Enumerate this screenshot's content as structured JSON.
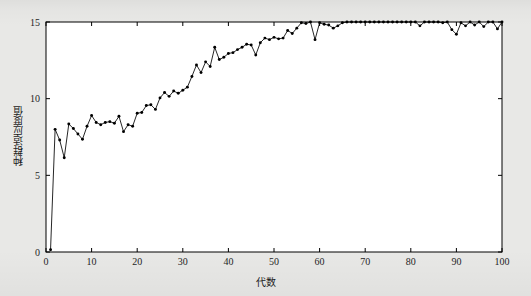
{
  "figure": {
    "background_color": "#e8e8e6",
    "plot_background_color": "#ffffff",
    "axis_color": "#000000",
    "line_color": "#000000",
    "marker_color": "#000000"
  },
  "chart_data": {
    "type": "line",
    "title": "",
    "xlabel": "代数",
    "ylabel": "种群适应度值",
    "xlim": [
      0,
      100
    ],
    "ylim": [
      0,
      15
    ],
    "xticks": [
      0,
      10,
      20,
      30,
      40,
      50,
      60,
      70,
      80,
      90,
      100
    ],
    "xticklabels": [
      "0",
      "10",
      "20",
      "30",
      "40",
      "50",
      "60",
      "70",
      "80",
      "90",
      "100"
    ],
    "yticks": [
      0,
      5,
      10,
      15
    ],
    "yticklabels": [
      "0",
      "5",
      "10",
      "15"
    ],
    "grid": false,
    "legend": null,
    "marker": "dot",
    "x": [
      1,
      2,
      3,
      4,
      5,
      6,
      7,
      8,
      9,
      10,
      11,
      12,
      13,
      14,
      15,
      16,
      17,
      18,
      19,
      20,
      21,
      22,
      23,
      24,
      25,
      26,
      27,
      28,
      29,
      30,
      31,
      32,
      33,
      34,
      35,
      36,
      37,
      38,
      39,
      40,
      41,
      42,
      43,
      44,
      45,
      46,
      47,
      48,
      49,
      50,
      51,
      52,
      53,
      54,
      55,
      56,
      57,
      58,
      59,
      60,
      61,
      62,
      63,
      64,
      65,
      66,
      67,
      68,
      69,
      70,
      71,
      72,
      73,
      74,
      75,
      76,
      77,
      78,
      79,
      80,
      81,
      82,
      83,
      84,
      85,
      86,
      87,
      88,
      89,
      90,
      91,
      92,
      93,
      94,
      95,
      96,
      97,
      98,
      99,
      100
    ],
    "y": [
      0.15,
      8.0,
      7.3,
      6.15,
      8.35,
      8.05,
      7.7,
      7.35,
      8.2,
      8.9,
      8.45,
      8.3,
      8.45,
      8.5,
      8.4,
      8.85,
      7.85,
      8.3,
      8.2,
      9.05,
      9.1,
      9.55,
      9.6,
      9.3,
      10.05,
      10.4,
      10.15,
      10.5,
      10.35,
      10.55,
      10.75,
      11.45,
      12.2,
      11.7,
      12.4,
      12.1,
      13.35,
      12.55,
      12.7,
      12.95,
      13.0,
      13.2,
      13.35,
      13.55,
      13.5,
      12.85,
      13.65,
      13.95,
      13.85,
      14.0,
      13.9,
      13.95,
      14.45,
      14.25,
      14.6,
      14.95,
      14.9,
      15.0,
      13.85,
      14.95,
      14.85,
      14.8,
      14.6,
      14.75,
      14.95,
      15.0,
      15.0,
      15.0,
      15.0,
      15.0,
      15.0,
      15.0,
      15.0,
      15.0,
      15.0,
      15.0,
      15.0,
      15.0,
      15.0,
      15.0,
      15.0,
      14.75,
      15.0,
      15.0,
      15.0,
      15.0,
      14.95,
      15.0,
      14.5,
      14.2,
      14.95,
      14.75,
      15.0,
      14.8,
      15.0,
      14.7,
      15.0,
      15.0,
      14.55,
      15.0
    ]
  }
}
